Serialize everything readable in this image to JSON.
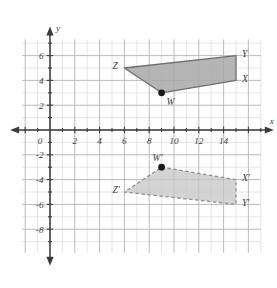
{
  "figure": {
    "axis_labels": {
      "x": "x",
      "y": "y"
    },
    "origin_label": "0"
  },
  "colors": {
    "grid_minor": "#d8d8d8",
    "grid_major": "#b4b4b4",
    "axis": "#3b3b3b",
    "shape_fill": "#a8a8a8",
    "shape_stroke": "#6e6e6e",
    "image_fill": "#c3c3c3",
    "image_stroke": "#8f8f8f",
    "label_text": "#3b3b3b",
    "vertex_dot": "#1a1a1a",
    "background": "#ffffff"
  },
  "chart_data": {
    "type": "scatter",
    "xlabel": "x",
    "ylabel": "y",
    "xlim": [
      -1,
      16
    ],
    "ylim": [
      -9.5,
      7.5
    ],
    "grid": true,
    "legend": "none",
    "x_ticks": [
      0,
      2,
      4,
      6,
      8,
      10,
      12,
      14
    ],
    "x_tick_labels": [
      "0",
      "2",
      "4",
      "6",
      "8",
      "10",
      "12",
      "14"
    ],
    "y_ticks": [
      6,
      4,
      2,
      -2,
      -4,
      -6,
      -8
    ],
    "y_tick_labels": [
      "6",
      "4",
      "2",
      "-2",
      "-4",
      "-6",
      "-8"
    ],
    "series": [
      {
        "name": "WXYZ",
        "style": "solid",
        "fill": "#a8a8a8",
        "stroke": "#6e6e6e",
        "points": [
          {
            "label": "W",
            "x": 9,
            "y": 3,
            "marker": "dot",
            "label_pos": "below-right"
          },
          {
            "label": "X",
            "x": 15,
            "y": 4,
            "marker": "none",
            "label_pos": "right"
          },
          {
            "label": "Y",
            "x": 15,
            "y": 6,
            "marker": "none",
            "label_pos": "right"
          },
          {
            "label": "Z",
            "x": 6,
            "y": 5,
            "marker": "none",
            "label_pos": "left"
          }
        ]
      },
      {
        "name": "W'X'Y'Z'",
        "style": "dashed",
        "fill": "#c3c3c3",
        "stroke": "#8f8f8f",
        "points": [
          {
            "label": "W'",
            "x": 9,
            "y": -3,
            "marker": "dot",
            "label_pos": "above-left"
          },
          {
            "label": "X'",
            "x": 15,
            "y": -4,
            "marker": "none",
            "label_pos": "right"
          },
          {
            "label": "Y'",
            "x": 15,
            "y": -6,
            "marker": "none",
            "label_pos": "right"
          },
          {
            "label": "Z'",
            "x": 6,
            "y": -5,
            "marker": "none",
            "label_pos": "left"
          }
        ]
      }
    ]
  }
}
